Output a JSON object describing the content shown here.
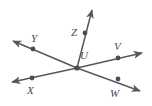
{
  "figure": {
    "type": "geometry-diagram",
    "background_color": "#ffffff",
    "stroke_color": "#58585a",
    "label_color": "#4a4a4a",
    "point_color": "#4d4d4f",
    "width": 152,
    "height": 106,
    "labels": [
      {
        "id": "label-Y",
        "text": "Y",
        "x": 31,
        "y": 33
      },
      {
        "id": "label-Z",
        "text": "Z",
        "x": 71,
        "y": 27
      },
      {
        "id": "label-U",
        "text": "U",
        "x": 80,
        "y": 50
      },
      {
        "id": "label-V",
        "text": "V",
        "x": 114,
        "y": 41
      },
      {
        "id": "label-X",
        "text": "X",
        "x": 27,
        "y": 85
      },
      {
        "id": "label-W",
        "text": "W",
        "x": 110,
        "y": 88
      }
    ],
    "vertex": {
      "id": "U",
      "x": 77,
      "y": 68
    },
    "dots": [
      {
        "id": "dot-Y",
        "x": 33,
        "y": 49
      },
      {
        "id": "dot-Z",
        "x": 85,
        "y": 33
      },
      {
        "id": "dot-V",
        "x": 118,
        "y": 58
      },
      {
        "id": "dot-X",
        "x": 32,
        "y": 78
      },
      {
        "id": "dot-W",
        "x": 118,
        "y": 79
      },
      {
        "id": "dot-U",
        "x": 77,
        "y": 68
      }
    ],
    "rays": [
      {
        "id": "ray-UY",
        "from": "U",
        "through": "Y",
        "tip_x": 10,
        "tip_y": 39
      },
      {
        "id": "ray-UW",
        "from": "U",
        "through": "W",
        "tip_x": 143,
        "tip_y": 93
      },
      {
        "id": "ray-UX",
        "from": "U",
        "through": "X",
        "tip_x": 9,
        "tip_y": 83
      },
      {
        "id": "ray-UV",
        "from": "U",
        "through": "V",
        "tip_x": 145,
        "tip_y": 52
      },
      {
        "id": "ray-UZ",
        "from": "U",
        "through": "Z",
        "tip_x": 93,
        "tip_y": 7
      }
    ]
  }
}
